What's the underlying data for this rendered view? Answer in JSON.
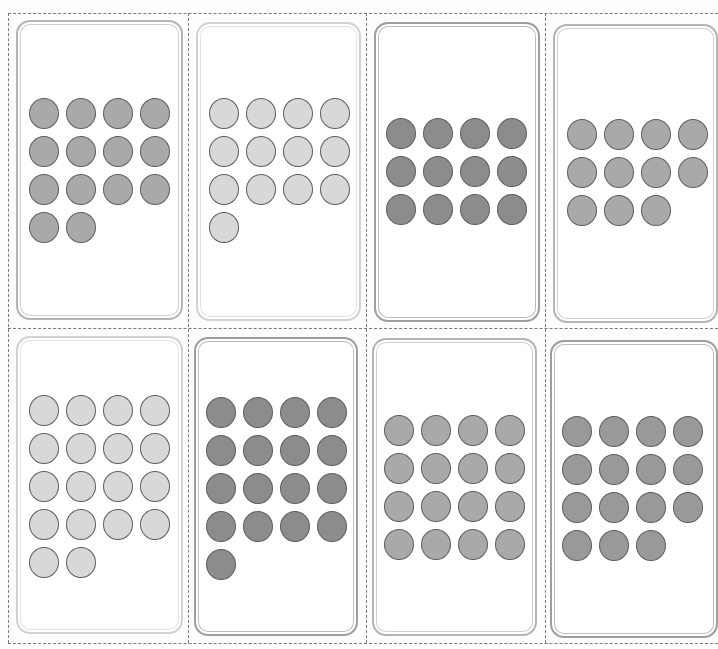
{
  "sheet": {
    "description": "Printable dot-count cards, 2 rows x 4 columns, separated by dashed cut lines",
    "colors": {
      "light": "#d8d8d8",
      "medium": "#a9a9a9",
      "medium_dark": "#999999",
      "dark": "#8c8c8c",
      "dot_outline": "#5e5e5e",
      "cut_line": "#7a7a7a"
    }
  },
  "cards": [
    {
      "id": 1,
      "row": 1,
      "col": 1,
      "dot_count": 14,
      "shade": "medium",
      "frame": "normal",
      "left": 16,
      "top": 20,
      "width": 167,
      "height": 300,
      "dots_left": 11,
      "dots_top": 76
    },
    {
      "id": 2,
      "row": 1,
      "col": 2,
      "dot_count": 13,
      "shade": "light",
      "frame": "light",
      "left": 196,
      "top": 22,
      "width": 165,
      "height": 299,
      "dots_left": 11,
      "dots_top": 74
    },
    {
      "id": 3,
      "row": 1,
      "col": 3,
      "dot_count": 12,
      "shade": "dark",
      "frame": "dark",
      "left": 374,
      "top": 22,
      "width": 166,
      "height": 300,
      "dots_left": 10,
      "dots_top": 94
    },
    {
      "id": 4,
      "row": 1,
      "col": 4,
      "dot_count": 11,
      "shade": "medium",
      "frame": "normal",
      "left": 553,
      "top": 24,
      "width": 165,
      "height": 299,
      "dots_left": 12,
      "dots_top": 93
    },
    {
      "id": 5,
      "row": 2,
      "col": 1,
      "dot_count": 18,
      "shade": "light",
      "frame": "light",
      "left": 16,
      "top": 336,
      "width": 167,
      "height": 298,
      "dots_left": 11,
      "dots_top": 57
    },
    {
      "id": 6,
      "row": 2,
      "col": 2,
      "dot_count": 17,
      "shade": "dark",
      "frame": "dark",
      "left": 194,
      "top": 337,
      "width": 164,
      "height": 299,
      "dots_left": 10,
      "dots_top": 58
    },
    {
      "id": 7,
      "row": 2,
      "col": 3,
      "dot_count": 16,
      "shade": "medium",
      "frame": "normal",
      "left": 372,
      "top": 338,
      "width": 165,
      "height": 298,
      "dots_left": 10,
      "dots_top": 75
    },
    {
      "id": 8,
      "row": 2,
      "col": 4,
      "dot_count": 15,
      "shade": "medium_dark",
      "frame": "dark",
      "left": 550,
      "top": 340,
      "width": 168,
      "height": 298,
      "dots_left": 10,
      "dots_top": 74
    }
  ]
}
